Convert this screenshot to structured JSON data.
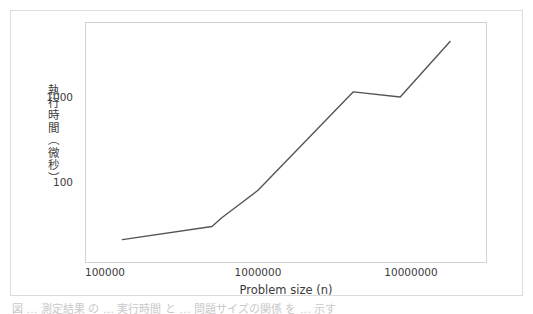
{
  "figure": {
    "background_color": "#ffffff",
    "border_color": "#dcdcdc",
    "plot_border_color": "#d2d2d2",
    "line_color": "#555555",
    "text_color": "#3c3c3c"
  },
  "axes": {
    "ylabel": "執行時間（微秒）",
    "xlabel": "Problem size (n)",
    "ytick_labels": [
      "1000",
      "100"
    ],
    "xtick_labels": [
      "100000",
      "1000000",
      "10000000"
    ]
  },
  "caption": {
    "text": "図 …  測定結果  の …  実行時間  と  …  問題サイズの関係  を  …  示す"
  },
  "chart_data": {
    "type": "line",
    "title": "",
    "xlabel": "Problem size (n)",
    "ylabel": "執行時間（微秒）",
    "xscale": "log",
    "yscale": "log",
    "xlim": [
      70000,
      33000000
    ],
    "ylim": [
      16,
      11000
    ],
    "grid": false,
    "legend": null,
    "xtick_values": [
      100000,
      1000000,
      10000000
    ],
    "xtick_labels": [
      "100000",
      "1000000",
      "10000000"
    ],
    "ytick_values": [
      100,
      1000
    ],
    "ytick_labels": [
      "100",
      "1000"
    ],
    "series": [
      {
        "name": "execution time",
        "color": "#555555",
        "linewidth": 1.4,
        "marker": "none",
        "x": [
          130000,
          500000,
          580000,
          1000000,
          4200000,
          8500000,
          18000000
        ],
        "y": [
          21,
          30,
          38,
          80,
          1150,
          1000,
          4500
        ]
      }
    ],
    "points_pixel": [
      [
        122,
        260
      ],
      [
        180,
        241
      ],
      [
        222,
        227
      ],
      [
        253,
        200
      ],
      [
        345,
        92
      ],
      [
        395,
        99
      ],
      [
        438,
        36
      ]
    ]
  }
}
